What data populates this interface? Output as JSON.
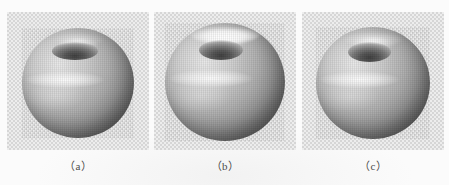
{
  "figure": {
    "background_color": "#fbfbfb",
    "panel_background_color": "#ededed",
    "panel_checker_color": "#d6d6d6",
    "panel_count": 3,
    "panels": [
      {
        "id": "a",
        "caption": "（a）",
        "object_name": "shaded-apple-surface",
        "description": "grayscale rendered apple-like surface of revolution with top dimple",
        "object_width_px": 112,
        "object_height_px": 110,
        "dimple_width_px": 46,
        "dimple_height_px": 18,
        "crown_highlight_opacity": 0.1,
        "specular_band": "upper-left to center"
      },
      {
        "id": "b",
        "caption": "（b）",
        "object_name": "shaded-apple-surface",
        "description": "grayscale rendered apple-like surface with bright white crown highlight at top",
        "object_width_px": 120,
        "object_height_px": 118,
        "dimple_width_px": 44,
        "dimple_height_px": 20,
        "crown_highlight_opacity": 0.95,
        "specular_band": "broad, across upper-middle"
      },
      {
        "id": "c",
        "caption": "（c）",
        "object_name": "shaded-apple-surface",
        "description": "grayscale rendered apple-like surface with deeper top dimple",
        "object_width_px": 114,
        "object_height_px": 112,
        "dimple_width_px": 44,
        "dimple_height_px": 20,
        "crown_highlight_opacity": 0.28,
        "specular_band": "upper-left to center, tighter"
      }
    ]
  }
}
